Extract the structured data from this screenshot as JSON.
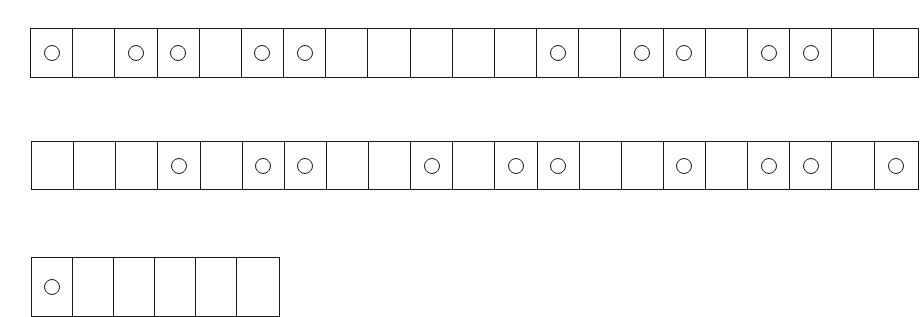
{
  "diagram": {
    "type": "cell-strips",
    "stroke_color": "#1a1a1a",
    "background": "#ffffff",
    "strips": [
      {
        "cells": [
          1,
          0,
          1,
          1,
          0,
          1,
          1,
          0,
          0,
          0,
          0,
          0,
          1,
          0,
          1,
          1,
          0,
          1,
          1,
          0,
          0
        ]
      },
      {
        "cells": [
          0,
          0,
          0,
          1,
          0,
          1,
          1,
          0,
          0,
          1,
          0,
          1,
          1,
          0,
          0,
          1,
          0,
          1,
          1,
          0,
          1
        ]
      },
      {
        "cells": [
          1,
          0,
          0,
          0,
          0,
          0
        ]
      }
    ],
    "legend": {
      "1": "cell with circle",
      "0": "empty cell"
    }
  }
}
